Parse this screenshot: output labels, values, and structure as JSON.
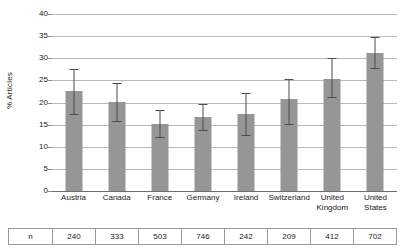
{
  "chart_data": {
    "type": "bar",
    "title": "",
    "xlabel": "",
    "ylabel": "% Articles",
    "ylim": [
      0,
      40
    ],
    "yticks": [
      0,
      5,
      10,
      15,
      20,
      25,
      30,
      35,
      40
    ],
    "ytick_labels": [
      "0",
      "5",
      "10",
      "15",
      "20",
      "25",
      "30",
      "35",
      "40"
    ],
    "grid": true,
    "legend": "none",
    "error_bars": "95% confidence interval",
    "bar_color": "#969696",
    "error_color": "#4d4d4d",
    "categories": [
      "Austria",
      "Canada",
      "France",
      "Germany",
      "Ireland",
      "Switzerland",
      "United Kingdom",
      "United States"
    ],
    "category_lines": [
      [
        "Austria"
      ],
      [
        "Canada"
      ],
      [
        "France"
      ],
      [
        "Germany"
      ],
      [
        "Ireland"
      ],
      [
        "Switzerland"
      ],
      [
        "United",
        "Kingdom"
      ],
      [
        "United",
        "States"
      ]
    ],
    "values": [
      22.5,
      20.2,
      15.2,
      16.7,
      17.5,
      20.8,
      25.3,
      31.2
    ],
    "err_low": [
      17.3,
      15.8,
      12.2,
      13.8,
      12.6,
      15.2,
      21.3,
      27.9
    ],
    "err_high": [
      27.6,
      24.5,
      18.4,
      19.6,
      22.2,
      25.4,
      30.0,
      34.9
    ],
    "n_label": "n",
    "n_values": [
      240,
      333,
      503,
      746,
      242,
      209,
      412,
      702
    ]
  }
}
